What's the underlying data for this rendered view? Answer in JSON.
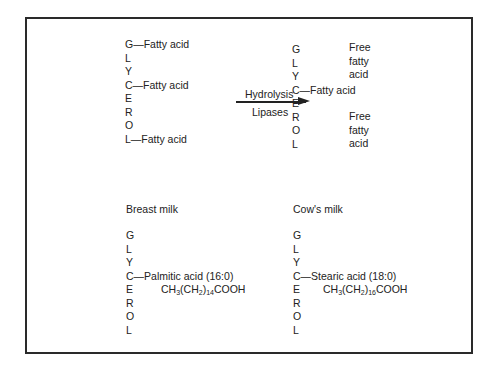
{
  "diagram": {
    "top_left": {
      "letters": [
        "G",
        "L",
        "Y",
        "C",
        "E",
        "R",
        "O",
        "L"
      ],
      "bond_1": "—Fatty acid",
      "bond_2": "—Fatty acid",
      "bond_3": "—Fatty acid"
    },
    "reaction": {
      "above_arrow": "Hydrolysis",
      "below_arrow": "Lipases"
    },
    "top_right": {
      "letters": [
        "G",
        "L",
        "Y",
        "C",
        "E",
        "R",
        "O",
        "L"
      ],
      "bond_middle": "—Fatty acid",
      "free_1": [
        "Free",
        "fatty",
        "acid"
      ],
      "free_2": [
        "Free",
        "fatty",
        "acid"
      ]
    },
    "breast_milk": {
      "title": "Breast milk",
      "letters": [
        "G",
        "L",
        "Y",
        "C",
        "E",
        "R",
        "O",
        "L"
      ],
      "bond": "—Palmitic acid (16:0)",
      "formula_a": "CH",
      "formula_sub1": "3",
      "formula_b": "(CH",
      "formula_sub2": "2",
      "formula_c": ")",
      "formula_sub3": "14",
      "formula_d": "COOH"
    },
    "cows_milk": {
      "title": "Cow's milk",
      "letters": [
        "G",
        "L",
        "Y",
        "C",
        "E",
        "R",
        "O",
        "L"
      ],
      "bond": "—Stearic  acid (18:0)",
      "formula_a": "CH",
      "formula_sub1": "3",
      "formula_b": "(CH",
      "formula_sub2": "2",
      "formula_c": ")",
      "formula_sub3": "16",
      "formula_d": "COOH"
    }
  }
}
